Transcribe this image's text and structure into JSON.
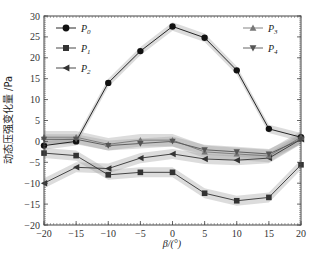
{
  "chart_data": {
    "type": "line",
    "title": "",
    "xlabel": "β/(°)",
    "ylabel": "动态压强变化量 /Pa",
    "x": [
      -20,
      -15,
      -10,
      -5,
      0,
      5,
      10,
      15,
      20
    ],
    "xlim": [
      -20,
      20
    ],
    "ylim": [
      -20,
      30
    ],
    "xticks": [
      -20,
      -15,
      -10,
      -5,
      0,
      5,
      10,
      15,
      20
    ],
    "yticks": [
      -20,
      -15,
      -10,
      -5,
      0,
      5,
      10,
      15,
      20,
      25,
      30
    ],
    "grid": false,
    "legend_position": "upper-left and upper-right",
    "shaded_band": "uncertainty band (gray) around each series",
    "series": [
      {
        "name": "P0",
        "sub": "0",
        "marker": "circle",
        "color": "#111111",
        "band": 1.0,
        "values": [
          -1,
          0,
          14,
          21.6,
          27.5,
          24.8,
          17,
          3,
          1
        ]
      },
      {
        "name": "P1",
        "sub": "1",
        "marker": "square",
        "color": "#333333",
        "band": 1.2,
        "values": [
          -2.8,
          -3.4,
          -8,
          -7.4,
          -7.4,
          -12.4,
          -14.2,
          -13.4,
          -5.6
        ]
      },
      {
        "name": "P2",
        "sub": "2",
        "marker": "triangle-left",
        "color": "#333333",
        "band": 1.2,
        "values": [
          -10,
          -6.2,
          -6.5,
          -4,
          -3,
          -4.2,
          -4.5,
          -4,
          0.5
        ]
      },
      {
        "name": "P3",
        "sub": "3",
        "marker": "triangle-up",
        "color": "#777777",
        "band": 1.5,
        "values": [
          1,
          1,
          -0.7,
          0.3,
          0.3,
          -2.5,
          -3,
          -3.5,
          1
        ]
      },
      {
        "name": "P4",
        "sub": "4",
        "marker": "triangle-down",
        "color": "#555555",
        "band": 1.2,
        "values": [
          0.5,
          0.5,
          -1,
          -0.5,
          0,
          -2,
          -2.5,
          -3,
          0.5
        ]
      }
    ]
  },
  "labels": {
    "xlabel": "β/(°)",
    "ylabel": "动态压强变化量 /Pa"
  }
}
